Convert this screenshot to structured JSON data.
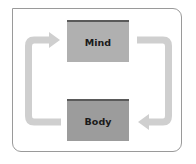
{
  "diagram": {
    "type": "cycle",
    "nodes": [
      {
        "id": "mind",
        "label": "Mind",
        "fill": "#b0b0b0",
        "top_border": "#5a5a5a"
      },
      {
        "id": "body",
        "label": "Body",
        "fill": "#9c9c9c",
        "top_border": "#5a5a5a"
      }
    ],
    "edges": [
      {
        "from": "mind",
        "to": "body",
        "side": "right",
        "direction": "clockwise"
      },
      {
        "from": "body",
        "to": "mind",
        "side": "left",
        "direction": "clockwise"
      }
    ],
    "arrow_color": "#cfcfcf",
    "frame_border_color": "#9a9a9a"
  }
}
